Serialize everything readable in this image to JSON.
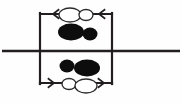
{
  "figure": {
    "width": 182,
    "height": 104,
    "background_color": "#fefefe",
    "line_color": "#231f20",
    "filled_ellipse_color": "#0d0d0d",
    "open_ellipse_fill": "#ffffff",
    "open_ellipse_stroke": "#2b2b2b"
  },
  "chart_data": {
    "type": "diagram",
    "xlabel": "",
    "ylabel": "",
    "xlim": [
      0,
      182
    ],
    "ylim": [
      0,
      104
    ],
    "grid": false,
    "legend": "none",
    "elements": [
      {
        "name": "interface-line",
        "kind": "line",
        "x1": 2,
        "y1": 51,
        "x2": 180,
        "y2": 51,
        "stroke_width": 2.6,
        "color": "#231f20"
      },
      {
        "name": "loop-top-edge",
        "kind": "line",
        "x1": 40,
        "y1": 14,
        "x2": 112,
        "y2": 14,
        "stroke_width": 2.2,
        "color": "#231f20"
      },
      {
        "name": "loop-bottom-edge",
        "kind": "line",
        "x1": 40,
        "y1": 83,
        "x2": 112,
        "y2": 83,
        "stroke_width": 2.2,
        "color": "#231f20"
      },
      {
        "name": "loop-left-edge",
        "kind": "line",
        "x1": 40,
        "y1": 14,
        "x2": 40,
        "y2": 83,
        "stroke_width": 2.2,
        "color": "#231f20"
      },
      {
        "name": "loop-right-edge",
        "kind": "line",
        "x1": 112,
        "y1": 14,
        "x2": 112,
        "y2": 83,
        "stroke_width": 2.2,
        "color": "#231f20"
      },
      {
        "name": "arrowhead-top-left",
        "kind": "arrowhead",
        "x": 53,
        "y": 14,
        "direction": "left"
      },
      {
        "name": "arrowhead-top-right",
        "kind": "arrowhead",
        "x": 99,
        "y": 14,
        "direction": "left"
      },
      {
        "name": "arrowhead-bottom-left",
        "kind": "arrowhead",
        "x": 54,
        "y": 83,
        "direction": "right"
      },
      {
        "name": "arrowhead-bottom-right",
        "kind": "arrowhead",
        "x": 104,
        "y": 83,
        "direction": "right"
      },
      {
        "name": "upper-open-ellipse-large",
        "kind": "ellipse",
        "cx": 70,
        "cy": 15,
        "rx": 11,
        "ry": 7,
        "style": "open"
      },
      {
        "name": "upper-open-ellipse-small",
        "kind": "ellipse",
        "cx": 86,
        "cy": 15,
        "rx": 7,
        "ry": 5.5,
        "style": "open"
      },
      {
        "name": "upper-filled-ellipse-large",
        "kind": "ellipse",
        "cx": 71,
        "cy": 32,
        "rx": 13,
        "ry": 8.5,
        "style": "filled"
      },
      {
        "name": "upper-filled-ellipse-small",
        "kind": "ellipse",
        "cx": 90,
        "cy": 34,
        "rx": 7.5,
        "ry": 6.5,
        "style": "filled"
      },
      {
        "name": "lower-filled-ellipse-small",
        "kind": "ellipse",
        "cx": 67,
        "cy": 66,
        "rx": 7.5,
        "ry": 6.5,
        "style": "filled"
      },
      {
        "name": "lower-filled-ellipse-large",
        "cx": 87,
        "cy": 68,
        "rx": 13,
        "ry": 8.5,
        "kind": "ellipse",
        "style": "filled"
      },
      {
        "name": "lower-open-ellipse-small",
        "kind": "ellipse",
        "cx": 69,
        "cy": 84,
        "rx": 7,
        "ry": 5.5,
        "style": "open"
      },
      {
        "name": "lower-open-ellipse-large",
        "kind": "ellipse",
        "cx": 86,
        "cy": 86,
        "rx": 11,
        "ry": 7,
        "style": "open"
      }
    ]
  }
}
